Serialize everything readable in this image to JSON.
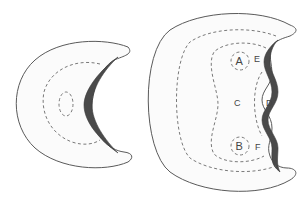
{
  "diagram": {
    "left_figure": {
      "description": "small crescent with dashed inner boundary and dashed oval"
    },
    "right_figure": {
      "labels": {
        "A": "A",
        "B": "B",
        "C": "C",
        "D": "D",
        "E": "E",
        "F": "F"
      }
    },
    "colors": {
      "outline": "#5a5a5a",
      "band": "#4a4a4a",
      "background": "#ffffff"
    }
  }
}
